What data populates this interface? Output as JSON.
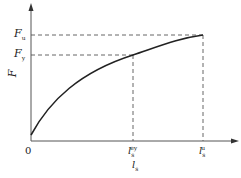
{
  "diagram": {
    "type": "force-slip curve",
    "y_axis": {
      "label": "F",
      "ticks": [
        {
          "main": "F",
          "sub": "u"
        },
        {
          "main": "F",
          "sub": "y"
        }
      ]
    },
    "x_axis": {
      "label_main": "l",
      "label_sub": "s",
      "ticks": [
        {
          "main": "l",
          "sub": "s",
          "sup": "ey"
        },
        {
          "main": "l",
          "sub": "s",
          "sup": "u"
        }
      ]
    },
    "origin": "0",
    "colors": {
      "axis": "#555555",
      "curve": "#222222",
      "dash": "#555555"
    }
  }
}
